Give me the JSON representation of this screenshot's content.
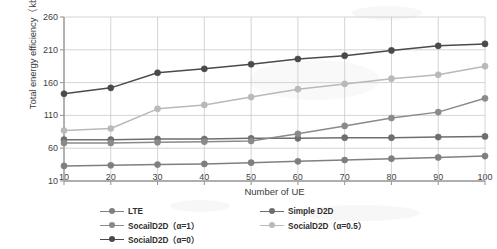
{
  "chart_data": {
    "type": "line",
    "title": "",
    "xlabel": "Number of UE",
    "ylabel": "Total energy efficiency（kb/J）",
    "x": [
      10,
      20,
      30,
      40,
      50,
      60,
      70,
      80,
      90,
      100
    ],
    "xlim": [
      10,
      100
    ],
    "ylim": [
      10,
      260
    ],
    "yticks": [
      10,
      60,
      110,
      160,
      210,
      260
    ],
    "xticks": [
      10,
      20,
      30,
      40,
      50,
      60,
      70,
      80,
      90,
      100
    ],
    "grid": true,
    "legend_position": "bottom",
    "series": [
      {
        "name": "LTE",
        "color": "#7f7f7f",
        "values": [
          33,
          34,
          35,
          36,
          38,
          40,
          42,
          44,
          46,
          48
        ]
      },
      {
        "name": "Simple D2D",
        "color": "#6e6e6e",
        "values": [
          73,
          73,
          74,
          74,
          75,
          75,
          76,
          76,
          77,
          78
        ]
      },
      {
        "name": "SocailD2D（α=1）",
        "color": "#8a8a8a",
        "values": [
          68,
          68,
          69,
          70,
          71,
          82,
          94,
          106,
          115,
          136
        ]
      },
      {
        "name": "SocialD2D（α=0.5）",
        "color": "#b9b9b9",
        "values": [
          87,
          90,
          120,
          126,
          138,
          150,
          158,
          166,
          172,
          185
        ]
      },
      {
        "name": "SocialD2D（α=0）",
        "color": "#4a4a4a",
        "values": [
          143,
          152,
          175,
          181,
          188,
          196,
          201,
          209,
          216,
          219
        ]
      }
    ]
  },
  "legend": {
    "items": [
      {
        "label": "LTE",
        "color": "#7f7f7f"
      },
      {
        "label": "SocailD2D（α=1）",
        "color": "#8a8a8a"
      },
      {
        "label": "SocialD2D（α=0）",
        "color": "#4a4a4a"
      },
      {
        "label": "Simple D2D",
        "color": "#6e6e6e"
      },
      {
        "label": "SocialD2D（α=0.5）",
        "color": "#b9b9b9"
      }
    ]
  },
  "axes": {
    "y_title": "Total energy efficiency（kb/J）",
    "x_title": "Number of UE",
    "y_tick_labels": [
      "260",
      "210",
      "160",
      "110",
      "60",
      "10"
    ],
    "x_tick_labels": [
      "10",
      "20",
      "30",
      "40",
      "50",
      "60",
      "70",
      "80",
      "90",
      "100"
    ]
  },
  "colors": {
    "axis": "#9a9a9a",
    "grid": "#c9c9c9",
    "text": "#3a3a3a"
  }
}
